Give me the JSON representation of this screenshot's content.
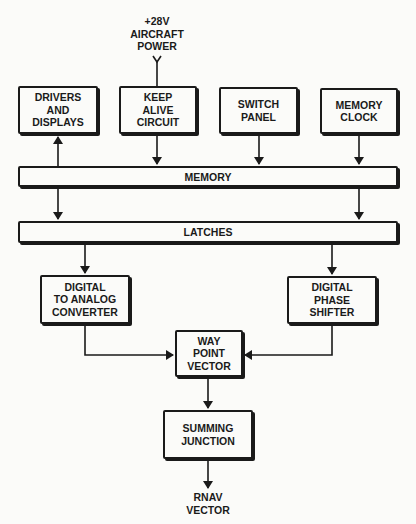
{
  "diagram": {
    "power_input": {
      "label": "+28V\nAIRCRAFT\nPOWER"
    },
    "blocks": {
      "drivers_displays": "DRIVERS\nAND\nDISPLAYS",
      "keep_alive": "KEEP\nALIVE\nCIRCUIT",
      "switch_panel": "SWITCH\nPANEL",
      "memory_clock": "MEMORY\nCLOCK",
      "memory": "MEMORY",
      "latches": "LATCHES",
      "dac": "DIGITAL\nTO ANALOG\nCONVERTER",
      "phase_shifter": "DIGITAL\nPHASE\nSHIFTER",
      "way_point": "WAY\nPOINT\nVECTOR",
      "summing": "SUMMING\nJUNCTION"
    },
    "output": {
      "label": "RNAV\nVECTOR"
    },
    "connections": [
      [
        "+28V AIRCRAFT POWER",
        "KEEP ALIVE CIRCUIT"
      ],
      [
        "MEMORY",
        "DRIVERS AND DISPLAYS"
      ],
      [
        "KEEP ALIVE CIRCUIT",
        "MEMORY"
      ],
      [
        "SWITCH PANEL",
        "MEMORY"
      ],
      [
        "MEMORY CLOCK",
        "MEMORY"
      ],
      [
        "MEMORY",
        "LATCHES"
      ],
      [
        "LATCHES",
        "DIGITAL TO ANALOG CONVERTER"
      ],
      [
        "LATCHES",
        "DIGITAL PHASE SHIFTER"
      ],
      [
        "DIGITAL TO ANALOG CONVERTER",
        "WAY POINT VECTOR"
      ],
      [
        "DIGITAL PHASE SHIFTER",
        "WAY POINT VECTOR"
      ],
      [
        "WAY POINT VECTOR",
        "SUMMING JUNCTION"
      ],
      [
        "SUMMING JUNCTION",
        "RNAV VECTOR"
      ]
    ]
  }
}
